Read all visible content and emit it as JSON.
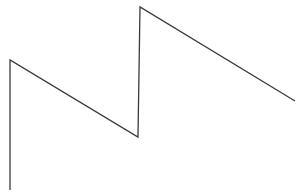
{
  "diagram": {
    "type": "polyline",
    "stroke_color": "#3a3a3a",
    "stroke_width": 1.3,
    "background": "#ffffff",
    "points": [
      [
        10,
        190
      ],
      [
        10,
        60
      ],
      [
        138,
        137
      ],
      [
        140,
        7
      ],
      [
        295,
        101
      ]
    ]
  }
}
